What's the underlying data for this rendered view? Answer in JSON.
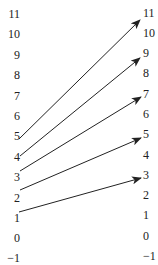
{
  "diagram": {
    "type": "mapping",
    "left_axis": {
      "labels": [
        "11",
        "10",
        "9",
        "8",
        "7",
        "6",
        "5",
        "4",
        "3",
        "2",
        "1",
        "0",
        "−1"
      ],
      "y": [
        14,
        34,
        55,
        75,
        96,
        116,
        136,
        157,
        177,
        198,
        218,
        238,
        258
      ]
    },
    "right_axis": {
      "labels": [
        "11",
        "10",
        "9",
        "8",
        "7",
        "6",
        "5",
        "4",
        "3",
        "2",
        "1",
        "0",
        "−1"
      ],
      "y": [
        13,
        33,
        53,
        73,
        94,
        114,
        134,
        155,
        175,
        195,
        215,
        236,
        256
      ]
    },
    "arrows": [
      {
        "from": "5",
        "to": "11",
        "x1": 19,
        "y1": 139,
        "x2": 140,
        "y2": 20
      },
      {
        "from": "4",
        "to": "9",
        "x1": 20,
        "y1": 156,
        "x2": 140,
        "y2": 58
      },
      {
        "from": "3",
        "to": "7",
        "x1": 20,
        "y1": 171,
        "x2": 141,
        "y2": 97
      },
      {
        "from": "2",
        "to": "5",
        "x1": 20,
        "y1": 190,
        "x2": 141,
        "y2": 138
      },
      {
        "from": "1",
        "to": "3",
        "x1": 19,
        "y1": 212,
        "x2": 141,
        "y2": 178
      }
    ],
    "colors": {
      "line": "#222222",
      "text": "#222222",
      "background": "#ffffff"
    }
  }
}
